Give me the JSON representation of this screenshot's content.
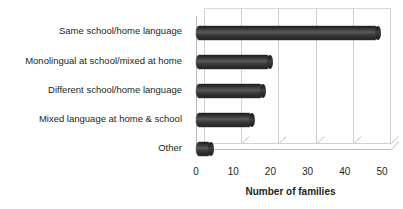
{
  "chart_data": {
    "type": "bar",
    "orientation": "horizontal",
    "title": "",
    "subtitle": "",
    "xlabel": "Number of families",
    "ylabel": "",
    "xlim": [
      0,
      50
    ],
    "xticks": [
      0,
      10,
      20,
      30,
      40,
      50
    ],
    "grid": true,
    "legend": false,
    "legend_position": "none",
    "style_3d": true,
    "bar_color": "#3a3a3a",
    "categories": [
      "Same school/home language",
      "Monolingual at school/mixed at home",
      "Different school/home language",
      "Mixed language at home & school",
      "Other"
    ],
    "values": [
      49,
      20,
      18,
      15,
      4
    ]
  }
}
